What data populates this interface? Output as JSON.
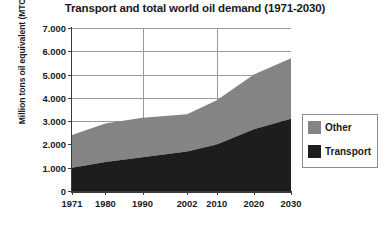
{
  "chart_data": {
    "type": "area",
    "title": "Transport and total world oil demand (1971-2030)",
    "xlabel": "",
    "ylabel": "Million tons oil equivalent (MTOE)",
    "categories": [
      "1971",
      "1980",
      "1990",
      "2002",
      "2010",
      "2020",
      "2030"
    ],
    "x_positions": [
      1971,
      1980,
      1990,
      2002,
      2010,
      2020,
      2030
    ],
    "xlim": [
      1971,
      2030
    ],
    "ylim": [
      0,
      7000
    ],
    "y_ticks": [
      0,
      1000,
      2000,
      3000,
      4000,
      5000,
      6000,
      7000
    ],
    "y_tick_labels": [
      "0",
      "1.000",
      "2.000",
      "3.000",
      "4.000",
      "5.000",
      "6.000",
      "7.000"
    ],
    "grid": true,
    "stacked": true,
    "legend_position": "right",
    "series": [
      {
        "name": "Transport",
        "color": "#1d1d1d",
        "values": [
          1000,
          1250,
          1450,
          1700,
          2000,
          2650,
          3100
        ]
      },
      {
        "name": "Other",
        "color": "#848484",
        "values": [
          1400,
          1650,
          1700,
          1600,
          1900,
          2350,
          2600
        ]
      }
    ],
    "totals": [
      2400,
      2900,
      3150,
      3300,
      3900,
      5000,
      5700
    ]
  },
  "legend": {
    "items": [
      {
        "label": "Other",
        "color": "#848484"
      },
      {
        "label": "Transport",
        "color": "#1d1d1d"
      }
    ]
  }
}
